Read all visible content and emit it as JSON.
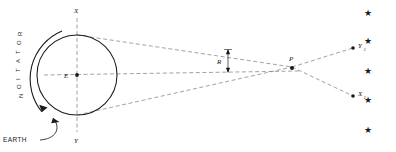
{
  "figure": {
    "background_color": "#ffffff",
    "line_color": "#1a1a1a",
    "dash_color": "#6b6b6b"
  },
  "earth": {
    "label": "EARTH",
    "center_label": "E",
    "top_point_label": "X",
    "bottom_point_label": "Y",
    "rotation_label": "ROTATION",
    "rotation_letters": [
      "R",
      "O",
      "T",
      "A",
      "T",
      "I",
      "O",
      "N"
    ],
    "cx": 77,
    "cy": 75,
    "r": 40
  },
  "object": {
    "label": "P",
    "x": 292,
    "y": 67
  },
  "angle": {
    "label": "R",
    "x": 219,
    "y": 59
  },
  "projections": [
    {
      "label": "Y",
      "sub": "1",
      "x": 355,
      "y": 48
    },
    {
      "label": "X",
      "sub": "1",
      "x": 355,
      "y": 96
    }
  ],
  "stars": [
    {
      "x": 368,
      "y": 16
    },
    {
      "x": 368,
      "y": 44
    },
    {
      "x": 368,
      "y": 74
    },
    {
      "x": 368,
      "y": 103
    },
    {
      "x": 368,
      "y": 133
    }
  ]
}
